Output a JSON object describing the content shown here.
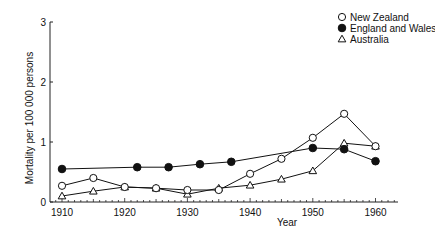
{
  "chart_data": {
    "type": "line",
    "title": "",
    "xlabel": "Year",
    "ylabel": "Mortality per 100 000 persons",
    "xlim": [
      1910,
      1962
    ],
    "ylim": [
      0,
      3
    ],
    "x_ticks": [
      1910,
      1920,
      1930,
      1940,
      1950,
      1960
    ],
    "y_ticks": [
      0,
      1,
      2,
      3
    ],
    "grid": false,
    "legend_position": "top-right",
    "series": [
      {
        "name": "New Zealand",
        "marker": "open-circle",
        "points": [
          [
            1910,
            0.27
          ],
          [
            1915,
            0.4
          ],
          [
            1920,
            0.25
          ],
          [
            1925,
            0.23
          ],
          [
            1930,
            0.2
          ],
          [
            1935,
            0.2
          ],
          [
            1940,
            0.47
          ],
          [
            1945,
            0.72
          ],
          [
            1950,
            1.07
          ],
          [
            1955,
            1.47
          ],
          [
            1960,
            0.93
          ]
        ]
      },
      {
        "name": "England and Wales",
        "marker": "filled-circle",
        "points": [
          [
            1910,
            0.55
          ],
          [
            1922,
            0.58
          ],
          [
            1927,
            0.58
          ],
          [
            1932,
            0.63
          ],
          [
            1937,
            0.67
          ],
          [
            1950,
            0.9
          ],
          [
            1955,
            0.88
          ],
          [
            1960,
            0.68
          ]
        ]
      },
      {
        "name": "Australia",
        "marker": "open-triangle",
        "points": [
          [
            1910,
            0.1
          ],
          [
            1915,
            0.18
          ],
          [
            1920,
            0.25
          ],
          [
            1925,
            0.23
          ],
          [
            1930,
            0.13
          ],
          [
            1935,
            0.23
          ],
          [
            1940,
            0.28
          ],
          [
            1945,
            0.38
          ],
          [
            1950,
            0.52
          ],
          [
            1955,
            0.98
          ],
          [
            1960,
            0.93
          ]
        ]
      }
    ]
  },
  "legend": {
    "items": [
      {
        "label": "New Zealand",
        "marker": "open-circle"
      },
      {
        "label": "England and Wales",
        "marker": "filled-circle"
      },
      {
        "label": "Australia",
        "marker": "open-triangle"
      }
    ]
  },
  "axes": {
    "x_title": "Year",
    "y_title": "Mortality per 100 000 persons",
    "x_tick_labels": [
      "1910",
      "1920",
      "1930",
      "1940",
      "1950",
      "1960"
    ],
    "y_tick_labels": [
      "0",
      "1",
      "2",
      "3"
    ]
  }
}
